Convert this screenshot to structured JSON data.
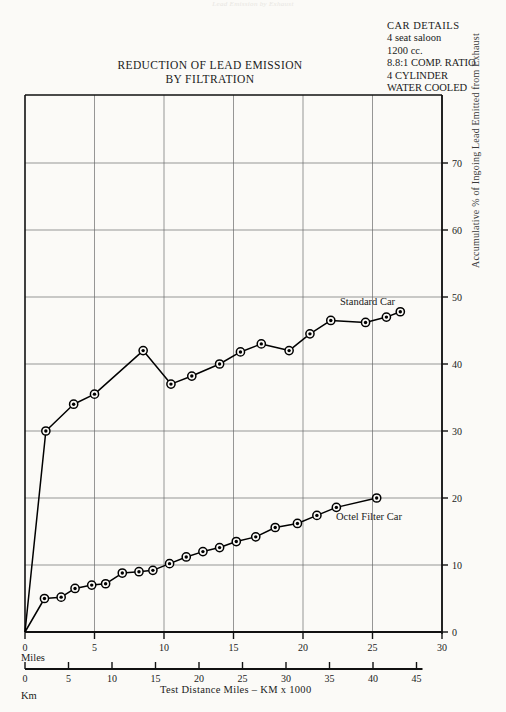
{
  "page": {
    "faint_header": "Lead Emission by Exhaust",
    "background": "#fbfaf7"
  },
  "title": {
    "line1": "REDUCTION OF LEAD EMISSION",
    "line2": "BY FILTRATION"
  },
  "car_details": {
    "heading": "CAR DETAILS",
    "lines": [
      "4 seat saloon",
      "1200 cc.",
      "8.8:1 COMP. RATIO",
      "4 CYLINDER",
      "WATER COOLED"
    ]
  },
  "axes": {
    "miles_unit": "Miles",
    "km_unit": "Km",
    "caption": "Test Distance Miles –  KM x 1000",
    "y_title": "Accumulative % of Ingoing Lead Emitted from Exhaust"
  },
  "chart_data": {
    "type": "line",
    "title": "REDUCTION OF LEAD EMISSION BY FILTRATION",
    "subtitle": "",
    "xlabel": "Test Distance Miles –  KM x 1000",
    "ylabel": "Accumulative % of Ingoing Lead Emitted from Exhaust",
    "xlim": [
      0,
      30
    ],
    "ylim": [
      0,
      75
    ],
    "x_ticks": [
      0,
      5,
      10,
      15,
      20,
      25,
      30
    ],
    "x_tick_labels": [
      "0",
      "5",
      "10",
      "15",
      "20",
      "25",
      "30"
    ],
    "x_secondary_ticks": [
      0,
      5,
      10,
      15,
      20,
      25,
      30,
      35,
      40,
      45
    ],
    "x_secondary_tick_labels": [
      "0",
      "5",
      "10",
      "15",
      "20",
      "25",
      "30",
      "35",
      "40",
      "45"
    ],
    "y_ticks": [
      0,
      10,
      20,
      30,
      40,
      50,
      60,
      70
    ],
    "y_tick_labels": [
      "0",
      "10",
      "20",
      "30",
      "40",
      "50",
      "60",
      "70"
    ],
    "grid": true,
    "legend_position": "inline-right",
    "marker": "target-circle",
    "series": [
      {
        "name": "Standard Car",
        "color": "#000000",
        "points": [
          [
            0.0,
            0.0
          ],
          [
            1.5,
            30.0
          ],
          [
            3.5,
            34.0
          ],
          [
            5.0,
            35.5
          ],
          [
            8.5,
            42.0
          ],
          [
            10.5,
            37.0
          ],
          [
            12.0,
            38.2
          ],
          [
            14.0,
            40.0
          ],
          [
            15.5,
            41.8
          ],
          [
            17.0,
            43.0
          ],
          [
            19.0,
            42.0
          ],
          [
            20.5,
            44.5
          ],
          [
            22.0,
            46.5
          ],
          [
            24.5,
            46.2
          ],
          [
            26.0,
            47.0
          ],
          [
            27.0,
            47.8
          ]
        ]
      },
      {
        "name": "Octel Filter Car",
        "color": "#000000",
        "points": [
          [
            0.0,
            0.0
          ],
          [
            1.4,
            5.0
          ],
          [
            2.6,
            5.2
          ],
          [
            3.6,
            6.5
          ],
          [
            4.8,
            7.0
          ],
          [
            5.8,
            7.2
          ],
          [
            7.0,
            8.8
          ],
          [
            8.2,
            9.0
          ],
          [
            9.2,
            9.2
          ],
          [
            10.4,
            10.2
          ],
          [
            11.6,
            11.2
          ],
          [
            12.8,
            12.0
          ],
          [
            14.0,
            12.6
          ],
          [
            15.2,
            13.5
          ],
          [
            16.6,
            14.2
          ],
          [
            18.0,
            15.6
          ],
          [
            19.6,
            16.2
          ],
          [
            21.0,
            17.4
          ],
          [
            22.4,
            18.6
          ],
          [
            25.3,
            20.0
          ]
        ]
      }
    ]
  }
}
